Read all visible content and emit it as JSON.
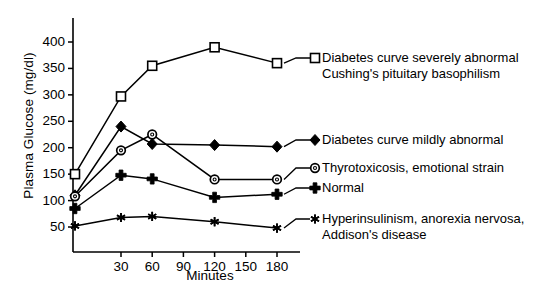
{
  "chart_data": {
    "type": "line",
    "title": "",
    "xlabel": "Minutes",
    "ylabel": "Plasma Glucose (mg/dl)",
    "xlim": [
      0,
      190
    ],
    "ylim": [
      25,
      425
    ],
    "grid": false,
    "legend_position": "right-inline-annotations",
    "x_ticks": [
      30,
      60,
      90,
      120,
      150,
      180
    ],
    "y_ticks": [
      50,
      100,
      150,
      200,
      250,
      300,
      350,
      400
    ],
    "x": [
      0,
      30,
      60,
      120,
      180
    ],
    "series": [
      {
        "name": "Diabetes curve severely abnormal / Cushing's pituitary basophilism",
        "label_line1": "Diabetes curve severely abnormal",
        "label_line2": "Cushing's pituitary basophilism",
        "marker": "open-square",
        "values": [
          150,
          297,
          355,
          390,
          360
        ]
      },
      {
        "name": "Diabetes curve mildly abnormal",
        "label_line1": "Diabetes curve mildly abnormal",
        "label_line2": "",
        "marker": "filled-diamond",
        "values": [
          110,
          240,
          207,
          205,
          202
        ]
      },
      {
        "name": "Thyrotoxicosis, emotional strain",
        "label_line1": "Thyrotoxicosis, emotional strain",
        "label_line2": "",
        "marker": "open-circle",
        "values": [
          108,
          195,
          225,
          140,
          140
        ]
      },
      {
        "name": "Normal",
        "label_line1": "Normal",
        "label_line2": "",
        "marker": "plus-cross",
        "values": [
          85,
          148,
          141,
          106,
          112
        ]
      },
      {
        "name": "Hyperinsulinism, anorexia nervosa, Addison's disease",
        "label_line1": "Hyperinsulinism, anorexia nervosa,",
        "label_line2": "Addison's disease",
        "marker": "asterisk",
        "values": [
          52,
          68,
          70,
          60,
          48
        ]
      }
    ],
    "colors": {
      "axis": "#000000",
      "line": "#000000",
      "marker_fill_open": "#ffffff",
      "marker_fill_solid": "#000000",
      "text": "#000000",
      "background": "#ffffff"
    }
  },
  "y_tick_labels": [
    "400",
    "350",
    "300",
    "250",
    "200",
    "150",
    "100",
    "50"
  ],
  "x_tick_labels": [
    "30",
    "60",
    "90",
    "120",
    "150",
    "180"
  ]
}
